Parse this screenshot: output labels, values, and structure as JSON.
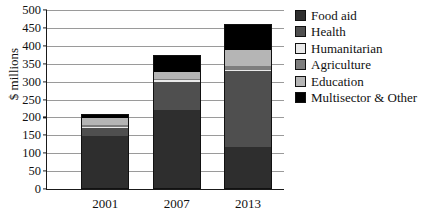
{
  "chart_data": {
    "type": "bar",
    "subtype": "stacked-bar",
    "title": "",
    "xlabel": "",
    "ylabel": "$ millions",
    "ylim": [
      0,
      500
    ],
    "ytick_step": 50,
    "yticks": [
      500,
      450,
      400,
      350,
      300,
      250,
      200,
      150,
      100,
      50,
      0
    ],
    "categories": [
      "2001",
      "2007",
      "2013"
    ],
    "grid": true,
    "legend_position": "right",
    "series": [
      {
        "name": "Food aid",
        "color": "#2e2e2e",
        "values": [
          150,
          220,
          115
        ]
      },
      {
        "name": "Health",
        "color": "#4f4f4f",
        "values": [
          22,
          80,
          215
        ]
      },
      {
        "name": "Humanitarian",
        "color": "#e9e9e9",
        "values": [
          3,
          5,
          5
        ]
      },
      {
        "name": "Agriculture",
        "color": "#7d7d7d",
        "values": [
          5,
          5,
          10
        ]
      },
      {
        "name": "Education",
        "color": "#b5b5b5",
        "values": [
          20,
          20,
          45
        ]
      },
      {
        "name": "Multisector & Other",
        "color": "#000000",
        "values": [
          10,
          45,
          70
        ]
      }
    ],
    "totals": [
      210,
      375,
      460
    ]
  },
  "legend": {
    "items": [
      {
        "label": "Food aid",
        "color": "#2e2e2e"
      },
      {
        "label": "Health",
        "color": "#4f4f4f"
      },
      {
        "label": "Humanitarian",
        "color": "#e9e9e9"
      },
      {
        "label": "Agriculture",
        "color": "#7d7d7d"
      },
      {
        "label": "Education",
        "color": "#b5b5b5"
      },
      {
        "label": "Multisector & Other",
        "color": "#000000"
      }
    ]
  },
  "axis": {
    "y_title": "$ millions",
    "y_labels": [
      "500",
      "450",
      "400",
      "350",
      "300",
      "250",
      "200",
      "150",
      "100",
      "50",
      "0"
    ],
    "x_labels": [
      "2001",
      "2007",
      "2013"
    ]
  },
  "colors": {
    "axis_line": "#1a1a1a",
    "gridline": "#9a9a9a",
    "background": "#ffffff",
    "text": "#111111"
  }
}
